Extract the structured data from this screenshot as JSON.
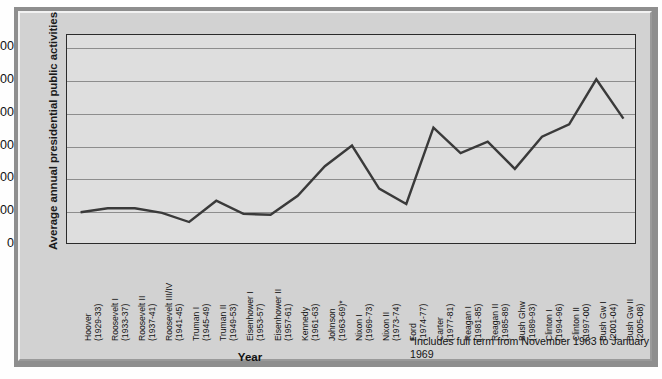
{
  "chart_data": {
    "type": "line",
    "title": "",
    "xlabel": "Year",
    "ylabel": "Average annual presidential public activities",
    "ylim": [
      0,
      640
    ],
    "yticks": [
      0,
      100,
      200,
      300,
      400,
      500,
      600
    ],
    "ytick_labels": [
      "0",
      "100",
      "200",
      "300",
      "400",
      "500",
      "600"
    ],
    "grid": true,
    "legend": null,
    "line_color": "#3a3a3a",
    "plot_bg": "#dedede",
    "categories": [
      "Hoover (1929-33)",
      "Roosevelt I (1933-37)",
      "Roosevelt II (1937-41)",
      "Roosevelt III/IV (1941-45)",
      "Truman I (1945-49)",
      "Truman II (1949-53)",
      "Eisenhower I (1953-57)",
      "Eisenhower II (1957-61)",
      "Kennedy (1961-63)",
      "Johnson (1963-69)*",
      "Nixon I (1969-73)",
      "Nixon II (1973-74)",
      "Ford (1974-77)",
      "Carter (1977-81)",
      "Reagan I (1981-85)",
      "Reagan II (1985-89)",
      "Bush Ghw (1989-93)",
      "Clinton I (1994-96)",
      "Clinton II (1997-00)",
      "Bush Gw I (2001-04)",
      "Bush Gw II (2005-08)"
    ],
    "tick_lines": [
      [
        "Hoover",
        "(1929-33)"
      ],
      [
        "Roosevelt I",
        "(1933-37)"
      ],
      [
        "Roosevelt II",
        "(1937-41)"
      ],
      [
        "Roosevelt III/IV",
        "(1941-45)"
      ],
      [
        "Truman I",
        "(1945-49)"
      ],
      [
        "Truman II",
        "(1949-53)"
      ],
      [
        "Eisenhower I",
        "(1953-57)"
      ],
      [
        "Eisenhower II",
        "(1957-61)"
      ],
      [
        "Kennedy",
        "(1961-63)"
      ],
      [
        "Johnson",
        "(1963-69)*"
      ],
      [
        "Nixon I",
        "(1969-73)"
      ],
      [
        "Nixon II",
        "(1973-74)"
      ],
      [
        "Ford",
        "(1974-77)"
      ],
      [
        "Carter",
        "(1977-81)"
      ],
      [
        "Reagan I",
        "(1981-85)"
      ],
      [
        "Reagan II",
        "(1985-89)"
      ],
      [
        "Bush Ghw",
        "(1989-93)"
      ],
      [
        "Clinton I",
        "(1994-96)"
      ],
      [
        "Clinton II",
        "(1997-00)"
      ],
      [
        "Bush Gw I",
        "(2001-04)"
      ],
      [
        "Bush Gw II",
        "(2005-08)"
      ]
    ],
    "values": [
      100,
      112,
      112,
      98,
      70,
      135,
      95,
      92,
      150,
      240,
      303,
      172,
      125,
      358,
      280,
      315,
      232,
      330,
      368,
      505,
      385
    ]
  },
  "footnote": {
    "text": "*Includes full term from November 1963 to January 1969"
  }
}
